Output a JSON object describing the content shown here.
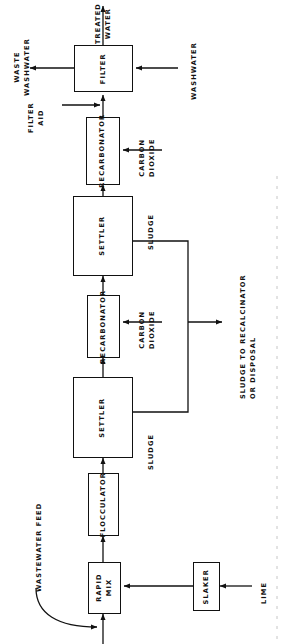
{
  "diagram": {
    "orientation": "rotated-90-ccw",
    "stroke_color": "#111111",
    "background_color": "#ffffff",
    "units": {
      "filter": "FILTER",
      "recarbonator_upper": "RECARBONATOR",
      "settler_upper": "SETTLER",
      "recarbonator_lower": "RECARBONATOR",
      "settler_lower": "SETTLER",
      "flocculator": "FLOCCULATOR",
      "rapid_mix": "RAPID\nMIX",
      "slaker": "SLAKER"
    },
    "stream_labels": {
      "treated_water": "TREATED\nWATER",
      "waste_washwater": "WASTE\nWASHWATER",
      "washwater": "WASHWATER",
      "filter_aid": "FILTER\nAID",
      "carbon_dioxide_upper": "CARBON\nDIOXIDE",
      "carbon_dioxide_lower": "CARBON\nDIOXIDE",
      "sludge_upper": "SLUDGE",
      "sludge_lower": "SLUDGE",
      "sludge_disposal": "SLUDGE TO RECALCINATOR\nOR DISPOSAL",
      "wastewater_feed": "WASTEWATER FEED",
      "lime": "LIME"
    }
  }
}
